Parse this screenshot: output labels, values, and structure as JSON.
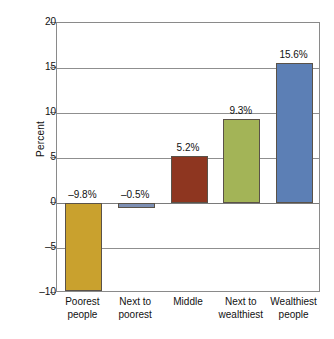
{
  "chart_data": {
    "type": "bar",
    "title": "",
    "xlabel": "",
    "ylabel": "Percent",
    "ylim": [
      -10,
      20
    ],
    "grid": true,
    "legend": "none",
    "categories": [
      "Poorest people",
      "Next to poorest",
      "Middle",
      "Next to wealthiest",
      "Wealthiest people"
    ],
    "category_lines": [
      [
        "Poorest",
        "people"
      ],
      [
        "Next to",
        "poorest"
      ],
      [
        "Middle",
        ""
      ],
      [
        "Next to",
        "wealthiest"
      ],
      [
        "Wealthiest",
        "people"
      ]
    ],
    "values": [
      -9.8,
      -0.5,
      5.2,
      9.3,
      15.6
    ],
    "data_labels": [
      "–9.8%",
      "–0.5%",
      "5.2%",
      "9.3%",
      "15.6%"
    ],
    "bar_colors": [
      "#C9A12E",
      "#7D8FB3",
      "#8E3620",
      "#A3B457",
      "#5C7FB5"
    ],
    "bar_border_color": "#5a5248",
    "yticks": [
      20,
      15,
      10,
      5,
      0,
      -5,
      -10
    ],
    "ytick_labels": [
      "20",
      "15",
      "10",
      "5",
      "0",
      "–5",
      "–10"
    ],
    "axis_color": "#8a8a8a",
    "gridline_color": "#8f8f8f",
    "background": "#ffffff"
  }
}
